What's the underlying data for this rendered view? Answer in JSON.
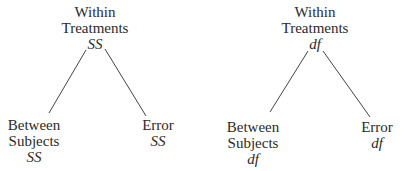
{
  "trees": [
    {
      "top": {
        "line1": "Within",
        "line2": "Treatments",
        "measure": "SS"
      },
      "left": {
        "line1": "Between",
        "line2": "Subjects",
        "measure": "SS"
      },
      "right": {
        "line1": "Error",
        "measure": "SS"
      }
    },
    {
      "top": {
        "line1": "Within",
        "line2": "Treatments",
        "measure": "df"
      },
      "left": {
        "line1": "Between",
        "line2": "Subjects",
        "measure": "df"
      },
      "right": {
        "line1": "Error",
        "measure": "df"
      }
    }
  ],
  "colors": {
    "text": "#2a2a2a",
    "line": "#444444"
  }
}
